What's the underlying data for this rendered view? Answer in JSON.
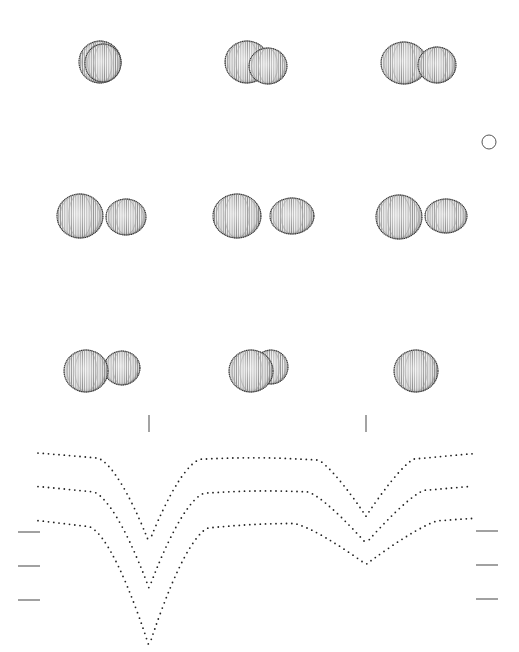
{
  "figure": {
    "colors": {
      "background": "#ffffff",
      "ink": "#222222",
      "star_fill": "#e6e6e6",
      "tick": "#666666"
    },
    "phase_frames": [
      {
        "id": 1,
        "row": 1,
        "col": 1,
        "stars": [
          {
            "cx": 100,
            "cy": 62,
            "rx": 21,
            "ry": 21,
            "role": "front"
          },
          {
            "cx": 103,
            "cy": 63,
            "rx": 18,
            "ry": 19,
            "role": "back-edge"
          }
        ]
      },
      {
        "id": 2,
        "row": 1,
        "col": 2,
        "stars": [
          {
            "cx": 247,
            "cy": 62,
            "rx": 22,
            "ry": 21,
            "role": "primary"
          },
          {
            "cx": 268,
            "cy": 66,
            "rx": 19,
            "ry": 18,
            "role": "secondary"
          }
        ]
      },
      {
        "id": 3,
        "row": 1,
        "col": 3,
        "stars": [
          {
            "cx": 404,
            "cy": 63,
            "rx": 23,
            "ry": 21,
            "role": "primary"
          },
          {
            "cx": 437,
            "cy": 65,
            "rx": 19,
            "ry": 18,
            "role": "secondary"
          }
        ]
      },
      {
        "id": 4,
        "row": 2,
        "col": 1,
        "stars": [
          {
            "cx": 80,
            "cy": 216,
            "rx": 23,
            "ry": 22,
            "role": "primary"
          },
          {
            "cx": 126,
            "cy": 217,
            "rx": 20,
            "ry": 18,
            "role": "secondary"
          }
        ]
      },
      {
        "id": 5,
        "row": 2,
        "col": 2,
        "stars": [
          {
            "cx": 237,
            "cy": 216,
            "rx": 24,
            "ry": 22,
            "role": "primary"
          },
          {
            "cx": 292,
            "cy": 216,
            "rx": 22,
            "ry": 18,
            "role": "secondary-teardrop"
          }
        ]
      },
      {
        "id": 6,
        "row": 2,
        "col": 3,
        "stars": [
          {
            "cx": 399,
            "cy": 217,
            "rx": 23,
            "ry": 22,
            "role": "primary"
          },
          {
            "cx": 446,
            "cy": 216,
            "rx": 21,
            "ry": 17,
            "role": "secondary"
          }
        ]
      },
      {
        "id": 7,
        "row": 3,
        "col": 1,
        "stars": [
          {
            "cx": 122,
            "cy": 368,
            "rx": 18,
            "ry": 17,
            "role": "secondary"
          },
          {
            "cx": 86,
            "cy": 371,
            "rx": 22,
            "ry": 21,
            "role": "primary"
          }
        ]
      },
      {
        "id": 8,
        "row": 3,
        "col": 2,
        "stars": [
          {
            "cx": 271,
            "cy": 367,
            "rx": 17,
            "ry": 17,
            "role": "secondary"
          },
          {
            "cx": 251,
            "cy": 371,
            "rx": 22,
            "ry": 21,
            "role": "primary"
          }
        ]
      },
      {
        "id": 9,
        "row": 3,
        "col": 3,
        "stars": [
          {
            "cx": 416,
            "cy": 371,
            "rx": 22,
            "ry": 21,
            "role": "single"
          }
        ]
      }
    ],
    "marker_circle": {
      "cx": 489,
      "cy": 142,
      "r": 7
    },
    "eclipse_ticks": [
      {
        "x": 149,
        "y1": 415,
        "y2": 432
      },
      {
        "x": 366,
        "y1": 415,
        "y2": 432
      }
    ],
    "level_marks_left": [
      {
        "x1": 18,
        "x2": 40,
        "y": 532
      },
      {
        "x1": 18,
        "x2": 40,
        "y": 566
      },
      {
        "x1": 18,
        "x2": 40,
        "y": 600
      }
    ],
    "level_marks_right": [
      {
        "x1": 476,
        "x2": 498,
        "y": 531
      },
      {
        "x1": 476,
        "x2": 498,
        "y": 565
      },
      {
        "x1": 476,
        "x2": 498,
        "y": 599
      }
    ]
  },
  "chart_data": {
    "type": "scatter",
    "title": "",
    "xlabel": "",
    "ylabel": "",
    "grid": false,
    "legend": null,
    "x_pixel_range": [
      38,
      472
    ],
    "annotations": [
      "primary eclipse tick at phase ~0.26",
      "secondary eclipse tick at phase ~0.76"
    ],
    "series": [
      {
        "name": "light curve 1 (top)",
        "start_y": 449,
        "plateau_y": 449,
        "min1": {
          "x": 149,
          "y": 542
        },
        "max_y": 449,
        "min2": {
          "x": 366,
          "y": 516
        },
        "end_y": 449,
        "dip1_halfwidth": 52,
        "dip2_halfwidth": 48
      },
      {
        "name": "light curve 2 (middle)",
        "start_y": 482,
        "plateau_y": 482,
        "min1": {
          "x": 149,
          "y": 588
        },
        "max_y": 482,
        "min2": {
          "x": 366,
          "y": 543
        },
        "end_y": 482,
        "dip1_halfwidth": 56,
        "dip2_halfwidth": 58
      },
      {
        "name": "light curve 3 (bottom)",
        "start_y": 515,
        "plateau_y": 515,
        "min1": {
          "x": 149,
          "y": 646
        },
        "max_y": 515,
        "min2": {
          "x": 366,
          "y": 564
        },
        "end_y": 515,
        "dip1_halfwidth": 60,
        "dip2_halfwidth": 72
      }
    ]
  }
}
